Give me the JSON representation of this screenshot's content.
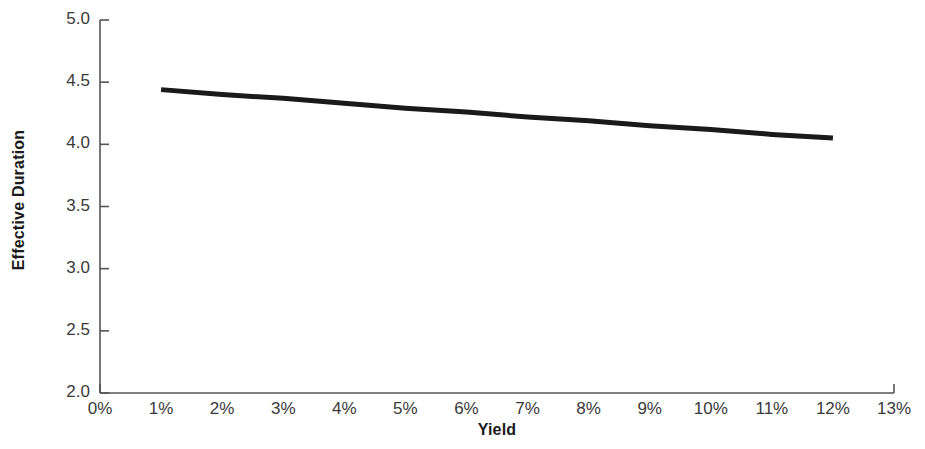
{
  "chart_data": {
    "type": "line",
    "title": "",
    "subtitle": "",
    "xlabel": "Yield",
    "ylabel": "Effective Duration",
    "xlim": [
      0,
      13
    ],
    "ylim": [
      2.0,
      5.0
    ],
    "grid": false,
    "legend": "none",
    "line_color": "#1a1a1a",
    "line_width_px": 5,
    "background_color": "#ffffff",
    "axis_color": "#555555",
    "x_tick_labels": [
      "0%",
      "1%",
      "2%",
      "3%",
      "4%",
      "5%",
      "6%",
      "7%",
      "8%",
      "9%",
      "10%",
      "11%",
      "12%",
      "13%"
    ],
    "x_tick_values": [
      0,
      1,
      2,
      3,
      4,
      5,
      6,
      7,
      8,
      9,
      10,
      11,
      12,
      13
    ],
    "y_tick_labels": [
      "2.0",
      "2.5",
      "3.0",
      "3.5",
      "4.0",
      "4.5",
      "5.0"
    ],
    "y_tick_values": [
      2.0,
      2.5,
      3.0,
      3.5,
      4.0,
      4.5,
      5.0
    ],
    "series": [
      {
        "name": "Effective Duration",
        "x": [
          1,
          2,
          3,
          4,
          5,
          6,
          7,
          8,
          9,
          10,
          11,
          12
        ],
        "values": [
          4.44,
          4.4,
          4.37,
          4.33,
          4.29,
          4.26,
          4.22,
          4.19,
          4.15,
          4.12,
          4.08,
          4.05
        ]
      }
    ],
    "annotations": []
  }
}
